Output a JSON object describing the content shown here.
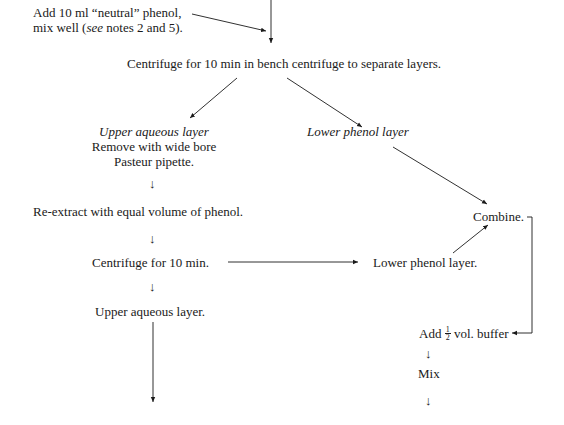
{
  "diagram": {
    "type": "flowchart",
    "steps": {
      "add_phenol": {
        "line1": "Add 10 ml “neutral” phenol,",
        "line2_pre": "mix well (",
        "line2_em": "see",
        "line2_post": " notes 2 and 5)."
      },
      "centrifuge_1": "Centrifuge for 10 min in bench centrifuge to separate layers.",
      "upper_aqueous_1": {
        "title": "Upper aqueous layer",
        "line1": "Remove with wide bore",
        "line2": "Pasteur pipette."
      },
      "lower_phenol_1": "Lower phenol layer",
      "reextract": "Re-extract with equal volume of phenol.",
      "centrifuge_2": "Centrifuge for 10 min.",
      "lower_phenol_2": "Lower phenol layer.",
      "upper_aqueous_2": "Upper aqueous layer.",
      "combine": "Combine.",
      "add_buffer": {
        "pre": "Add ",
        "frac_num": "1",
        "frac_den": "2",
        "post": " vol. buffer"
      },
      "mix": "Mix"
    },
    "arrow_glyph": "↓",
    "line_color": "#1a1a1a"
  }
}
